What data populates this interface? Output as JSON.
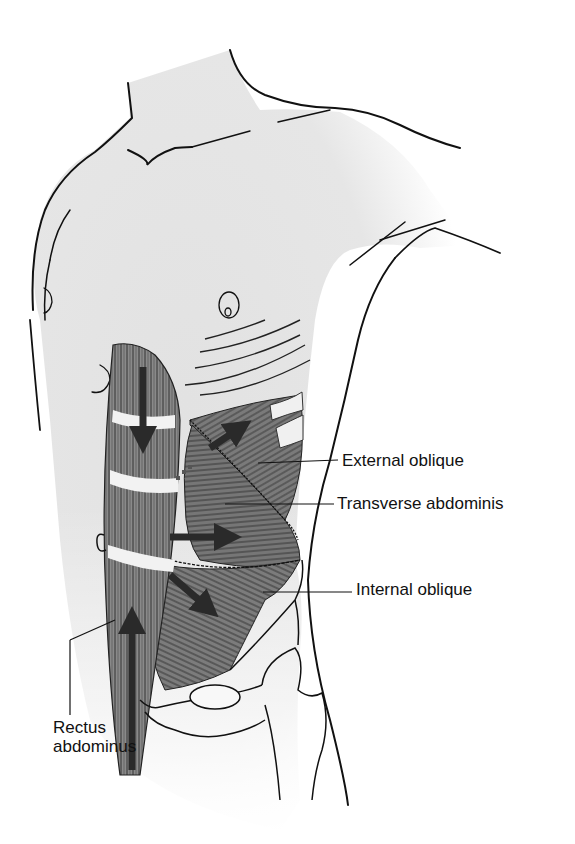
{
  "figure": {
    "labels": {
      "external_oblique": "External oblique",
      "transverse_abdominis": "Transverse abdominis",
      "internal_oblique": "Internal oblique",
      "rectus_line1": "Rectus",
      "rectus_line2": "abdominus"
    },
    "colors": {
      "skin": "#e6e6e6",
      "muscle": "#7a7a7a",
      "muscle_dark": "#555555",
      "outline": "#111111",
      "tendon": "#f4f4f4",
      "arrow": "#333333"
    },
    "arrows": [
      {
        "muscle": "rectus-abdominus",
        "direction": "down"
      },
      {
        "muscle": "rectus-abdominus",
        "direction": "up"
      },
      {
        "muscle": "external-oblique",
        "direction": "up-right"
      },
      {
        "muscle": "transverse-abdominis",
        "direction": "right"
      },
      {
        "muscle": "internal-oblique",
        "direction": "down-right"
      }
    ]
  }
}
